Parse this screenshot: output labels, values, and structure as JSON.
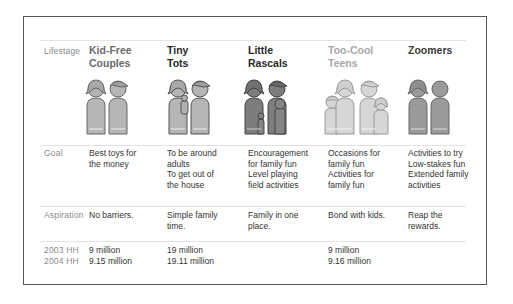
{
  "row_labels": {
    "lifestage": "Lifestage",
    "goal": "Goal",
    "aspiration": "Aspiration",
    "hh2003": "2003 HH",
    "hh2004": "2004 HH"
  },
  "segments": [
    {
      "title_line1": "Kid-Free",
      "title_line2": "Couples",
      "title_color": "#6b6b6b",
      "goal": [
        "Best toys for",
        "the money"
      ],
      "aspiration": [
        "No barriers."
      ],
      "hh2003": "9 million",
      "hh2004": "9.15 million",
      "icon": "couple-icon",
      "fill": "#b5b5b5"
    },
    {
      "title_line1": "Tiny",
      "title_line2": "Tots",
      "title_color": "#2a2a2a",
      "goal": [
        "To be around",
        "adults",
        "To get out of",
        "the house"
      ],
      "aspiration": [
        "Simple family",
        "time."
      ],
      "hh2003": "19 million",
      "hh2004": "19.11 million",
      "icon": "family-with-toddler-icon",
      "fill": "#b5b5b5"
    },
    {
      "title_line1": "Little",
      "title_line2": "Rascals",
      "title_color": "#2a2a2a",
      "goal": [
        "Encouragement",
        "for family fun",
        "Level playing",
        "field activities"
      ],
      "aspiration": [
        "Family in one",
        "place."
      ],
      "hh2003": "",
      "hh2004": "",
      "icon": "family-with-kids-icon",
      "fill": "#7d7d7d"
    },
    {
      "title_line1": "Too-Cool",
      "title_line2": "Teens",
      "title_color": "#a8a8a8",
      "goal": [
        "Occasions for",
        "family fun",
        "Activities for",
        "family fun"
      ],
      "aspiration": [
        "Bond with kids."
      ],
      "hh2003": "9 million",
      "hh2004": "9.16 million",
      "icon": "family-with-teens-icon",
      "fill": "#d6d6d6"
    },
    {
      "title_line1": "Zoomers",
      "title_line2": "",
      "title_color": "#3a3a3a",
      "goal": [
        "Activities to try",
        "Low-stakes fun",
        "Extended family",
        "activities"
      ],
      "aspiration": [
        "Reap the",
        "rewards."
      ],
      "hh2003": "",
      "hh2004": "",
      "icon": "senior-couple-icon",
      "fill": "#9a9a9a"
    }
  ]
}
